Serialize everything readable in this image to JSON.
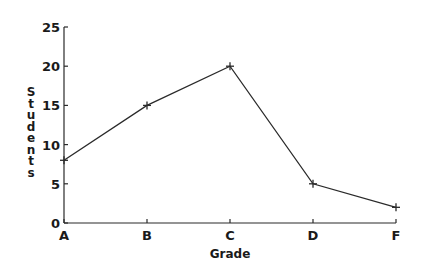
{
  "chart_data": {
    "type": "line",
    "title": "",
    "xlabel": "Grade",
    "ylabel": "Students",
    "categories": [
      "A",
      "B",
      "C",
      "D",
      "F"
    ],
    "series": [
      {
        "name": "Students",
        "values": [
          8,
          15,
          20,
          5,
          2
        ],
        "marker": "+"
      }
    ],
    "ylim": [
      0,
      25
    ],
    "yticks": [
      0,
      5,
      10,
      15,
      20,
      25
    ],
    "grid": false,
    "legend": null
  },
  "colors": {
    "line": "#2a2a2a",
    "axis": "#2a2a2a",
    "background": "#ffffff"
  }
}
